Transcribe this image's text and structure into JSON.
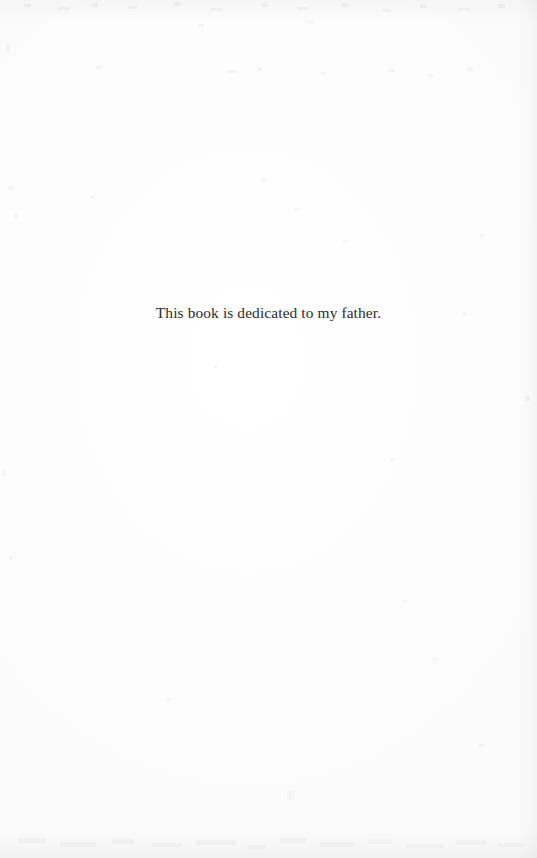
{
  "document": {
    "page_type": "dedication-page",
    "body": {
      "dedication_text": "This book is dedicated to my father."
    },
    "appearance": {
      "page_background": "#fefefe",
      "text_color": "#2b2b2b",
      "edge_shadow_color": "#9494a0"
    }
  }
}
